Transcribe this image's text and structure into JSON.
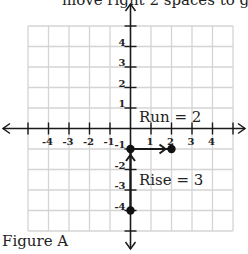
{
  "header": {
    "caption_partial": "move right 2 spaces to g"
  },
  "figure": {
    "label": "Figure A"
  },
  "chart_data": {
    "type": "scatter",
    "title": "",
    "xlabel": "",
    "ylabel": "",
    "xlim": [
      -5,
      5
    ],
    "ylim": [
      -5,
      5
    ],
    "grid": true,
    "x_tick_labels": [
      "-4",
      "-3",
      "-2",
      "-1",
      "1",
      "2",
      "3",
      "4"
    ],
    "y_tick_labels": [
      "4",
      "3",
      "2",
      "1",
      "-1",
      "-2",
      "-3",
      "-4"
    ],
    "points": [
      {
        "x": 0,
        "y": -4
      },
      {
        "x": 0,
        "y": -1
      },
      {
        "x": 2,
        "y": -1
      }
    ],
    "arrows": [
      {
        "from": [
          0,
          -4
        ],
        "to": [
          0,
          -1
        ],
        "label": "Rise = 3"
      },
      {
        "from": [
          0,
          -1
        ],
        "to": [
          2,
          -1
        ],
        "label": "Run = 2"
      }
    ],
    "annotations": [
      "Run = 2",
      "Rise = 3"
    ]
  },
  "colors": {
    "grid": "#d4d4d4",
    "axis": "#1a1a1a",
    "point": "#111111"
  }
}
